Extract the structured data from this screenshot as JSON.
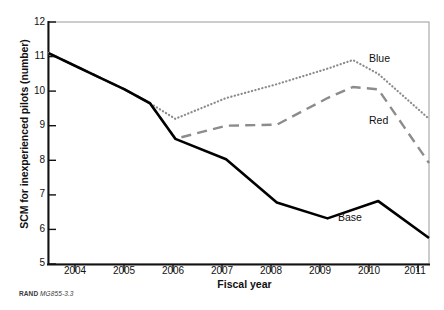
{
  "figure": {
    "source_note_prefix": "RAND",
    "source_note_id": "MG855-3.3",
    "background_color": "#ffffff",
    "border_color": "#9a9a9a"
  },
  "chart_data": {
    "type": "line",
    "title": "",
    "xlabel": "Fiscal year",
    "ylabel": "SCM for inexperienced pilots (number)",
    "xlim": [
      2003.5,
      2011.0
    ],
    "ylim": [
      5,
      12
    ],
    "yticks": [
      5,
      6,
      7,
      8,
      9,
      10,
      11,
      12
    ],
    "ytick_labels": [
      "5",
      "6",
      "7",
      "8",
      "9",
      "10",
      "11",
      "12"
    ],
    "xtick_labels": [
      "2004",
      "2005",
      "2006",
      "2007",
      "2008",
      "2009",
      "2010",
      "2011"
    ],
    "grid": false,
    "legend_position": "inline-right-labels",
    "series": [
      {
        "name": "Blue",
        "style": "dotted",
        "color": "#8c8c8c",
        "label": "Blue",
        "x": [
          2003.5,
          2004.0,
          2004.5,
          2005.0,
          2005.5,
          2006.0,
          2007.0,
          2008.0,
          2009.0,
          2009.5,
          2010.0,
          2011.0
        ],
        "y": [
          11.1,
          10.75,
          10.4,
          10.05,
          9.65,
          9.2,
          9.8,
          10.2,
          10.65,
          10.9,
          10.5,
          9.2
        ]
      },
      {
        "name": "Red",
        "style": "dashed",
        "color": "#8c8c8c",
        "label": "Red",
        "x": [
          2003.5,
          2004.0,
          2004.5,
          2005.0,
          2005.5,
          2006.0,
          2007.0,
          2008.0,
          2009.0,
          2009.5,
          2010.0,
          2011.0
        ],
        "y": [
          11.1,
          10.75,
          10.4,
          10.05,
          9.65,
          8.62,
          9.0,
          9.03,
          9.8,
          10.12,
          10.05,
          7.92
        ]
      },
      {
        "name": "Base",
        "style": "solid",
        "color": "#000000",
        "label": "Base",
        "x": [
          2003.5,
          2004.0,
          2004.5,
          2005.0,
          2005.5,
          2006.0,
          2007.0,
          2008.0,
          2009.0,
          2010.0,
          2011.0
        ],
        "y": [
          11.1,
          10.75,
          10.4,
          10.05,
          9.65,
          8.62,
          8.03,
          6.78,
          6.32,
          6.82,
          5.75
        ]
      }
    ]
  }
}
